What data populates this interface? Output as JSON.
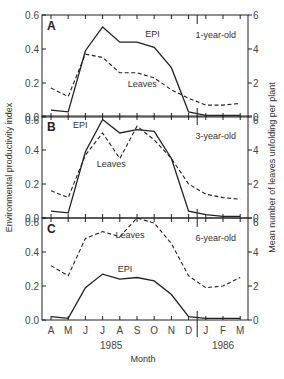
{
  "chart_data": {
    "type": "line",
    "layout": "three vertically stacked panels sharing x-axis, dual y-axes",
    "xlabel": "Month",
    "ylabel_left": "Environmental productivity index",
    "ylabel_right": "Mean number of leaves unfolding per plant",
    "x": [
      "A",
      "M",
      "J",
      "J",
      "A",
      "S",
      "O",
      "N",
      "D",
      "J",
      "F",
      "M"
    ],
    "year_labels": [
      {
        "label": "1985",
        "under_index": 3.5
      },
      {
        "label": "1986",
        "under_index": 10
      }
    ],
    "year_divider_between": [
      8,
      9
    ],
    "ylim_left": [
      0.0,
      0.6
    ],
    "ylim_right": [
      0,
      6
    ],
    "yticks_left": [
      "0.0",
      "0.2",
      "0.4",
      "0.6"
    ],
    "yticks_right": [
      "0",
      "2",
      "4",
      "6"
    ],
    "grid": false,
    "panels": [
      {
        "letter": "A",
        "annotation": "1-year-old",
        "series": [
          {
            "name": "EPI",
            "axis": "left",
            "style": "solid",
            "values": [
              0.04,
              0.03,
              0.39,
              0.53,
              0.44,
              0.44,
              0.41,
              0.29,
              0.03,
              0.01,
              0.01,
              0.01
            ],
            "label_pos": {
              "x_index": 5.9,
              "y": 0.47
            }
          },
          {
            "name": "Leaves",
            "axis": "right",
            "style": "dashed",
            "values": [
              1.7,
              1.2,
              3.7,
              3.5,
              2.6,
              2.6,
              2.3,
              1.6,
              1.1,
              0.7,
              0.7,
              0.8
            ],
            "label_pos": {
              "x_index": 5.3,
              "y": 1.75
            }
          }
        ]
      },
      {
        "letter": "B",
        "annotation": "3-year-old",
        "series": [
          {
            "name": "EPI",
            "axis": "left",
            "style": "solid",
            "values": [
              0.04,
              0.03,
              0.39,
              0.58,
              0.5,
              0.52,
              0.51,
              0.35,
              0.04,
              0.02,
              0.01,
              0.01
            ],
            "label_pos": {
              "x_index": 1.7,
              "y": 0.53
            }
          },
          {
            "name": "Leaves",
            "axis": "right",
            "style": "dashed",
            "values": [
              1.6,
              1.2,
              3.7,
              5.0,
              3.5,
              5.4,
              4.6,
              3.5,
              2.0,
              1.4,
              1.2,
              1.1
            ],
            "label_pos": {
              "x_index": 3.5,
              "y": 3.0
            }
          }
        ]
      },
      {
        "letter": "C",
        "annotation": "6-year-old",
        "series": [
          {
            "name": "EPI",
            "axis": "left",
            "style": "solid",
            "values": [
              0.02,
              0.01,
              0.19,
              0.27,
              0.24,
              0.25,
              0.23,
              0.15,
              0.02,
              0.01,
              0.01,
              0.01
            ],
            "label_pos": {
              "x_index": 4.3,
              "y": 0.28
            }
          },
          {
            "name": "Leaves",
            "axis": "right",
            "style": "dashed",
            "values": [
              3.2,
              2.6,
              4.8,
              5.2,
              4.9,
              6.0,
              5.7,
              4.5,
              2.6,
              1.9,
              2.0,
              2.5
            ],
            "label_pos": {
              "x_index": 4.6,
              "y": 4.8
            }
          }
        ]
      }
    ]
  }
}
